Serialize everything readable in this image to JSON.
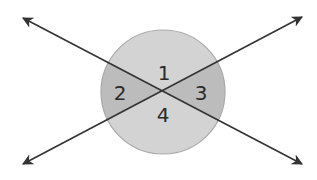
{
  "diagram": {
    "type": "vertical-angles",
    "colors": {
      "background": "#ffffff",
      "circle_fill_light": "#d3d3d3",
      "circle_fill_dark": "#bcbcbc",
      "circle_stroke": "#a9a9a9",
      "line_color": "#333333",
      "label_color": "#2a2a2a"
    },
    "circle": {
      "cx": 163,
      "cy": 92,
      "r": 62
    },
    "intersection": {
      "x": 163,
      "y": 91
    },
    "lines": [
      {
        "name": "line-a",
        "from": [
          23,
          18
        ],
        "to": [
          302,
          164
        ]
      },
      {
        "name": "line-b",
        "from": [
          23,
          164
        ],
        "to": [
          302,
          17
        ]
      }
    ],
    "angles": [
      {
        "id": "1",
        "label": "1",
        "x": 164,
        "y": 80
      },
      {
        "id": "2",
        "label": "2",
        "x": 120,
        "y": 100
      },
      {
        "id": "3",
        "label": "3",
        "x": 201,
        "y": 100
      },
      {
        "id": "4",
        "label": "4",
        "x": 163,
        "y": 122
      }
    ]
  }
}
